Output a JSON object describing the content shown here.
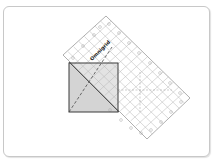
{
  "diagram": {
    "type": "quilting-ruler-illustration",
    "ruler": {
      "brand_label": "Omnigrid",
      "corners": {
        "top": [
          106,
          16
        ],
        "right": [
          190,
          98
        ],
        "bottom": [
          147,
          139
        ],
        "left": [
          63,
          55
        ]
      },
      "grid_color": "#b4b4b4",
      "edge_color": "#9a9a9a"
    },
    "square": {
      "x": 69,
      "y": 63,
      "size": 49,
      "fill": "#d4d4d4",
      "border": "#3a3a3a"
    },
    "lines": {
      "solid_diagonal": "ruler edge across square (top-left to bottom-right)",
      "dashed_diagonal": "square diagonal (bottom-left to top-right)"
    },
    "colors": {
      "frame_border": "#c8c8c8",
      "background": "#ffffff"
    }
  }
}
